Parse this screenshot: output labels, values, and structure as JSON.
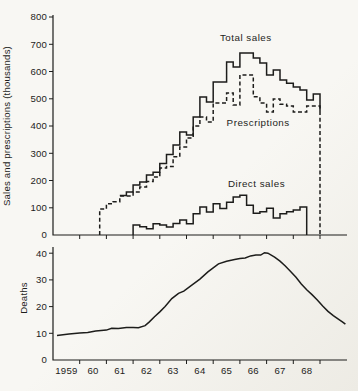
{
  "page": {
    "background": "#f6f5f0",
    "ink": "#1d1d1b"
  },
  "chart_data": [
    {
      "type": "line",
      "panel": "top",
      "title": "",
      "ylabel": "Sales and prescriptions (thousands)",
      "ylim": [
        0,
        800
      ],
      "yticks": [
        0,
        100,
        200,
        300,
        400,
        500,
        600,
        700,
        800
      ],
      "xlim": [
        1959,
        1970
      ],
      "xticks": [
        1960,
        1961,
        1962,
        1963,
        1964,
        1965,
        1966,
        1967,
        1968,
        1969
      ],
      "grid": false,
      "legend_position": "inline-annotations",
      "series": [
        {
          "name": "Total sales",
          "style": "solid",
          "draw": "step",
          "start": 1961.5,
          "step_years": 0.25,
          "values": [
            145,
            158,
            183,
            195,
            220,
            230,
            262,
            295,
            330,
            378,
            367,
            433,
            506,
            488,
            562,
            562,
            635,
            617,
            668,
            668,
            650,
            631,
            587,
            605,
            569,
            557,
            543,
            532,
            495,
            517
          ],
          "rise_from_zero": false,
          "end_drop": {
            "x": 1969.0,
            "to": 455
          },
          "label": {
            "text": "Total sales",
            "x": 1965.25,
            "y": 712
          }
        },
        {
          "name": "Prescriptions",
          "style": "dashed",
          "draw": "step",
          "start": 1960.75,
          "step_years": 0.25,
          "values": [
            95,
            115,
            122,
            143,
            143,
            158,
            176,
            196,
            213,
            246,
            251,
            287,
            323,
            356,
            400,
            433,
            415,
            484,
            484,
            521,
            477,
            587,
            587,
            507,
            484,
            451,
            499,
            480,
            473,
            451,
            451,
            473,
            473
          ],
          "rise_from_zero": true,
          "end_drop": {
            "x": 1969.0,
            "to": 0
          },
          "label": {
            "text": "Prescriptions",
            "x": 1965.5,
            "y": 400
          }
        },
        {
          "name": "Direct sales",
          "style": "solid",
          "draw": "step",
          "start": 1962.0,
          "step_years": 0.25,
          "values": [
            37,
            30,
            23,
            41,
            37,
            29,
            42,
            55,
            41,
            78,
            103,
            84,
            115,
            97,
            120,
            139,
            146,
            109,
            80,
            85,
            98,
            62,
            78,
            85,
            92,
            103
          ],
          "rise_from_zero": true,
          "end_drop": {
            "x": 1968.5,
            "to": 0
          },
          "label": {
            "text": "Direct sales",
            "x": 1965.55,
            "y": 175
          }
        }
      ]
    },
    {
      "type": "line",
      "panel": "bottom",
      "title": "",
      "ylabel": "Deaths",
      "ylim": [
        0,
        42
      ],
      "yticks": [
        0,
        10,
        20,
        30,
        40
      ],
      "xlim": [
        1959,
        1970
      ],
      "xticks": [
        1960,
        1961,
        1962,
        1963,
        1964,
        1965,
        1966,
        1967,
        1968,
        1969
      ],
      "xtick_labels": [
        {
          "text": "1959",
          "x": 1959.5
        },
        {
          "text": "60",
          "x": 1960.5
        },
        {
          "text": "61",
          "x": 1961.5
        },
        {
          "text": "62",
          "x": 1962.5
        },
        {
          "text": "63",
          "x": 1963.5
        },
        {
          "text": "64",
          "x": 1964.5
        },
        {
          "text": "65",
          "x": 1965.5
        },
        {
          "text": "66",
          "x": 1966.5
        },
        {
          "text": "67",
          "x": 1967.5
        },
        {
          "text": "68",
          "x": 1968.5
        }
      ],
      "grid": false,
      "series": [
        {
          "name": "Deaths",
          "style": "solid",
          "draw": "polyline",
          "points": [
            [
              1959.15,
              9.2
            ],
            [
              1959.6,
              9.7
            ],
            [
              1960.0,
              10.1
            ],
            [
              1960.3,
              10.3
            ],
            [
              1960.6,
              10.9
            ],
            [
              1961.0,
              11.2
            ],
            [
              1961.2,
              11.9
            ],
            [
              1961.45,
              11.8
            ],
            [
              1961.75,
              12.2
            ],
            [
              1962.0,
              12.2
            ],
            [
              1962.2,
              12.1
            ],
            [
              1962.45,
              12.9
            ],
            [
              1962.6,
              14.2
            ],
            [
              1962.8,
              16.2
            ],
            [
              1963.0,
              18.0
            ],
            [
              1963.2,
              20.0
            ],
            [
              1963.45,
              23.0
            ],
            [
              1963.7,
              25.0
            ],
            [
              1963.9,
              25.8
            ],
            [
              1964.2,
              28.0
            ],
            [
              1964.5,
              30.3
            ],
            [
              1964.8,
              33.0
            ],
            [
              1965.0,
              34.5
            ],
            [
              1965.2,
              36.0
            ],
            [
              1965.5,
              37.0
            ],
            [
              1965.8,
              37.6
            ],
            [
              1966.0,
              38.0
            ],
            [
              1966.2,
              38.2
            ],
            [
              1966.4,
              39.0
            ],
            [
              1966.6,
              39.3
            ],
            [
              1966.78,
              39.3
            ],
            [
              1966.92,
              40.2
            ],
            [
              1967.05,
              40.0
            ],
            [
              1967.3,
              38.5
            ],
            [
              1967.5,
              37.0
            ],
            [
              1967.7,
              35.2
            ],
            [
              1967.9,
              33.2
            ],
            [
              1968.1,
              31.0
            ],
            [
              1968.3,
              28.5
            ],
            [
              1968.5,
              26.3
            ],
            [
              1968.7,
              24.5
            ],
            [
              1968.9,
              22.5
            ],
            [
              1969.1,
              20.2
            ],
            [
              1969.3,
              18.2
            ],
            [
              1969.5,
              16.6
            ],
            [
              1969.7,
              15.2
            ],
            [
              1969.85,
              14.2
            ],
            [
              1969.95,
              13.4
            ]
          ]
        }
      ]
    }
  ]
}
